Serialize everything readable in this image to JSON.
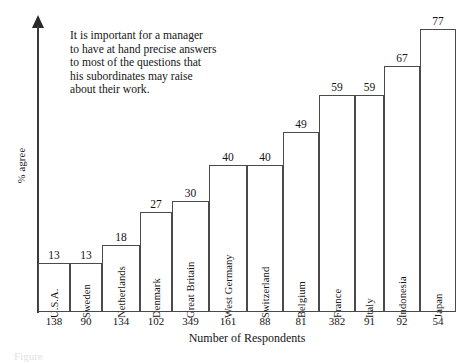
{
  "chart_data": {
    "type": "bar",
    "title": "",
    "xlabel": "Number of Respondents",
    "ylabel": "% agree",
    "ylim": [
      0,
      85
    ],
    "grid": false,
    "legend": "none",
    "orientation": "vertical",
    "note": "Variable-width bar chart: bar height = % agree, bar width proportional to number of respondents",
    "categories": [
      "U.S.A.",
      "Sweden",
      "Netherlands",
      "Denmark",
      "Great Britain",
      "West Germany",
      "Switzerland",
      "Belgium",
      "France",
      "Italy",
      "Indonesia",
      "Japan"
    ],
    "values": [
      13,
      13,
      18,
      27,
      30,
      40,
      40,
      49,
      59,
      59,
      67,
      77
    ],
    "respondents": [
      138,
      90,
      134,
      102,
      349,
      161,
      88,
      81,
      382,
      91,
      92,
      54
    ],
    "annotation": [
      "It is important for a manager",
      "to have at hand precise answers",
      "to most of the questions that",
      "his subordinates may raise",
      "about their work."
    ]
  },
  "colors": {
    "bar_outline": "#4a4a4a",
    "axis": "#3a3a3a",
    "text": "#141414",
    "background": "#ffffff"
  },
  "caption_remnant": "Figure"
}
